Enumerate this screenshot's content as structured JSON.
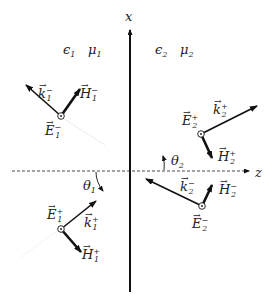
{
  "diagram": {
    "axes": {
      "x_label": "x",
      "z_label": "z"
    },
    "media": [
      {
        "epsilon": "ϵ",
        "epsilon_sub": "1",
        "mu": "μ",
        "mu_sub": "1"
      },
      {
        "epsilon": "ϵ",
        "epsilon_sub": "2",
        "mu": "μ",
        "mu_sub": "2"
      }
    ],
    "angles": [
      {
        "sym": "θ",
        "sub": "1"
      },
      {
        "sym": "θ",
        "sub": "2"
      }
    ],
    "vectors": [
      {
        "sym": "k",
        "sup": "−",
        "sub": "1"
      },
      {
        "sym": "H",
        "sup": "−",
        "sub": "1"
      },
      {
        "sym": "E",
        "sup": "−",
        "sub": "1"
      },
      {
        "sym": "E",
        "sup": "+",
        "sub": "1"
      },
      {
        "sym": "k",
        "sup": "+",
        "sub": "1"
      },
      {
        "sym": "H",
        "sup": "+",
        "sub": "1"
      },
      {
        "sym": "E",
        "sup": "+",
        "sub": "2"
      },
      {
        "sym": "k",
        "sup": "+",
        "sub": "2"
      },
      {
        "sym": "H",
        "sup": "+",
        "sub": "2"
      },
      {
        "sym": "k",
        "sup": "−",
        "sub": "2"
      },
      {
        "sym": "H",
        "sup": "−",
        "sub": "2"
      },
      {
        "sym": "E",
        "sup": "−",
        "sub": "2"
      }
    ],
    "arrow_symbol": "→"
  }
}
